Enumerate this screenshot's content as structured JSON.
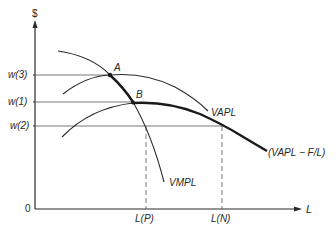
{
  "diagram": {
    "type": "economics-labor-demand",
    "y_axis_label": "$",
    "x_axis_label": "L",
    "origin_label": "0",
    "wage_levels": [
      {
        "label": "w(3)",
        "y": 75
      },
      {
        "label": "w(1)",
        "y": 102
      },
      {
        "label": "w(2)",
        "y": 126
      }
    ],
    "x_markers": [
      {
        "label": "L(P)",
        "x": 146
      },
      {
        "label": "L(N)",
        "x": 222
      }
    ],
    "curves": [
      {
        "name": "VMPL",
        "label": "VMPL",
        "weight": "thin"
      },
      {
        "name": "VAPL",
        "label": "VAPL",
        "weight": "thin"
      },
      {
        "name": "VAPL-F/L",
        "label": "(VAPL − F/L)",
        "weight": "thick"
      }
    ],
    "points": [
      {
        "label": "A",
        "description": "VMPL crosses VAPL at w(3)"
      },
      {
        "label": "B",
        "description": "VMPL crosses (VAPL - F/L) at w(1)"
      }
    ],
    "colors": {
      "ink": "#2a2a2a",
      "guide": "#555555",
      "background": "#ffffff"
    }
  }
}
